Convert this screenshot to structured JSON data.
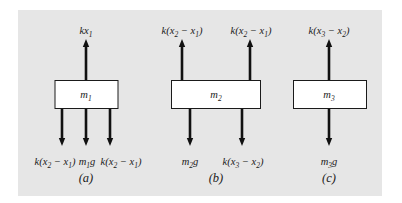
{
  "diagram": {
    "background_color": "#e6e6e6",
    "box_color": "#ffffff",
    "arrow_color": "#111111",
    "parts": [
      {
        "caption": "(a)",
        "mass_label": "m",
        "mass_sub": "1",
        "up_forces": [
          {
            "pre": "kx",
            "sub1": "1",
            "mid": "",
            "sub2": "",
            "post": ""
          }
        ],
        "down_forces": [
          {
            "pre": "k(x",
            "sub1": "2",
            "mid": " − x",
            "sub2": "1",
            "post": ")"
          },
          {
            "pre": "m",
            "sub1": "1",
            "mid": "g",
            "sub2": "",
            "post": ""
          },
          {
            "pre": "k(x",
            "sub1": "2",
            "mid": " − x",
            "sub2": "1",
            "post": ")"
          }
        ]
      },
      {
        "caption": "(b)",
        "mass_label": "m",
        "mass_sub": "2",
        "up_forces": [
          {
            "pre": "k(x",
            "sub1": "2",
            "mid": " − x",
            "sub2": "1",
            "post": ")"
          },
          {
            "pre": "k(x",
            "sub1": "2",
            "mid": " − x",
            "sub2": "1",
            "post": ")"
          }
        ],
        "down_forces": [
          {
            "pre": "m",
            "sub1": "2",
            "mid": "g",
            "sub2": "",
            "post": ""
          },
          {
            "pre": "k(x",
            "sub1": "3",
            "mid": " − x",
            "sub2": "2",
            "post": ")"
          }
        ]
      },
      {
        "caption": "(c)",
        "mass_label": "m",
        "mass_sub": "3",
        "up_forces": [
          {
            "pre": "k(x",
            "sub1": "3",
            "mid": " − x",
            "sub2": "2",
            "post": ")"
          }
        ],
        "down_forces": [
          {
            "pre": "m",
            "sub1": "3",
            "mid": "g",
            "sub2": "",
            "post": ""
          }
        ]
      }
    ]
  }
}
